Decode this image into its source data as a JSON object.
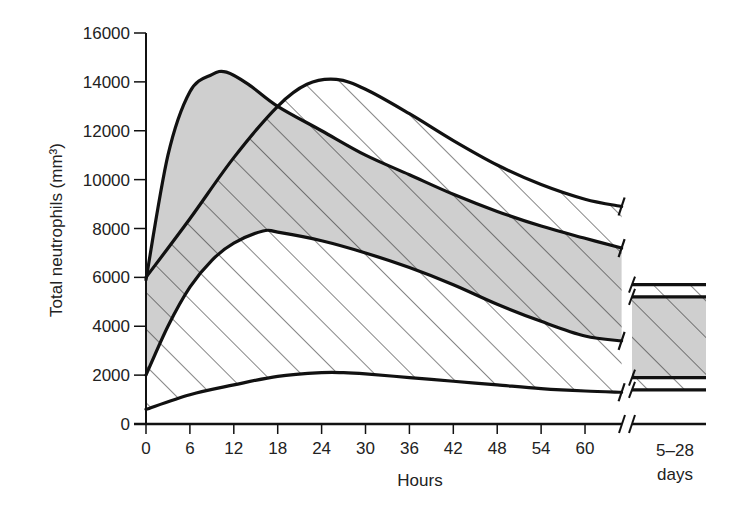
{
  "chart_data": {
    "type": "area",
    "title": "",
    "xlabel": "Hours",
    "ylabel": "Total neutrophils (mm³)",
    "ylim": [
      0,
      16000
    ],
    "xlim": [
      0,
      65
    ],
    "x_ticks": [
      0,
      6,
      12,
      18,
      24,
      30,
      36,
      42,
      48,
      54,
      60
    ],
    "y_ticks": [
      0,
      2000,
      4000,
      6000,
      8000,
      10000,
      12000,
      14000,
      16000
    ],
    "grid": false,
    "break_label": "5–28\ndays",
    "series": [
      {
        "name": "Gray band (upper bound)",
        "fill": "gray",
        "x": [
          0,
          3,
          6,
          9,
          11,
          14,
          18,
          24,
          30,
          36,
          42,
          48,
          54,
          60,
          65
        ],
        "values": [
          5900,
          11000,
          13600,
          14300,
          14400,
          13900,
          13000,
          12000,
          11000,
          10200,
          9400,
          8700,
          8100,
          7600,
          7200
        ],
        "late_value": 5200
      },
      {
        "name": "Gray band (lower bound)",
        "fill": "gray",
        "x": [
          0,
          3,
          6,
          9,
          12,
          16,
          18,
          24,
          30,
          36,
          42,
          48,
          54,
          60,
          65
        ],
        "values": [
          2000,
          4000,
          5600,
          6700,
          7400,
          7900,
          7850,
          7500,
          7000,
          6400,
          5700,
          4900,
          4200,
          3600,
          3400
        ],
        "late_value": 1900
      },
      {
        "name": "Hatched band (upper bound)",
        "fill": "hatched",
        "x": [
          0,
          6,
          12,
          18,
          22,
          26,
          30,
          36,
          42,
          48,
          54,
          60,
          65
        ],
        "values": [
          6000,
          8400,
          10900,
          13000,
          13900,
          14100,
          13700,
          12700,
          11600,
          10600,
          9800,
          9200,
          8900
        ],
        "late_value": 5700
      },
      {
        "name": "Hatched band (lower bound)",
        "fill": "hatched",
        "x": [
          0,
          6,
          12,
          18,
          24,
          27,
          30,
          36,
          42,
          48,
          54,
          60,
          65
        ],
        "values": [
          600,
          1200,
          1600,
          1950,
          2100,
          2100,
          2050,
          1900,
          1750,
          1600,
          1450,
          1350,
          1300
        ],
        "late_value": 1400
      }
    ]
  },
  "labels": {
    "ylabel": "Total neutrophils (mm³)",
    "xlabel": "Hours",
    "days_top": "5–28",
    "days_bottom": "days"
  }
}
